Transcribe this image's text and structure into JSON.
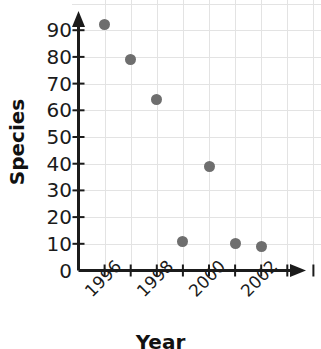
{
  "chart_data": {
    "type": "scatter",
    "title": "",
    "xlabel": "Year",
    "ylabel": "Species",
    "x": [
      1996,
      1997,
      1998,
      1999,
      2000,
      2001,
      2002
    ],
    "values": [
      92,
      79,
      64,
      11,
      39,
      10,
      9
    ],
    "points": [
      {
        "x": 1996,
        "y": 92
      },
      {
        "x": 1997,
        "y": 79
      },
      {
        "x": 1998,
        "y": 64
      },
      {
        "x": 1999,
        "y": 11
      },
      {
        "x": 2000,
        "y": 39
      },
      {
        "x": 2001,
        "y": 10
      },
      {
        "x": 2002,
        "y": 9
      }
    ],
    "xlim": [
      1995,
      2004
    ],
    "ylim": [
      0,
      95
    ],
    "ytick_labels": [
      "90",
      "80",
      "70",
      "60",
      "50",
      "40",
      "30",
      "20",
      "10",
      "0"
    ],
    "ytick_values": [
      90,
      80,
      70,
      60,
      50,
      40,
      30,
      20,
      10,
      0
    ],
    "xtick_values": [
      1996,
      1997,
      1998,
      1999,
      2000,
      2001,
      2002,
      2003,
      2004
    ],
    "xtick_labels_shown": [
      "1996",
      "1998",
      "2000",
      "2002"
    ],
    "xtick_labels_shown_values": [
      1996,
      1998,
      2000,
      2002
    ],
    "grid": true,
    "legend": "none",
    "marker_color": "#6e6e6e",
    "grid_color": "#e3e3e3",
    "axis_color": "#1b1b1b"
  }
}
